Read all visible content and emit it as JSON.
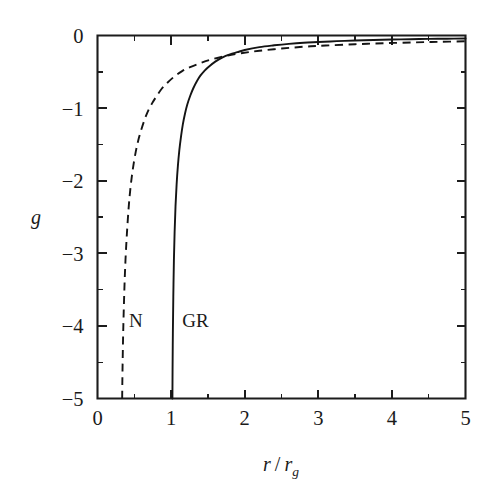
{
  "figure": {
    "background_color": "#ffffff",
    "ink_color": "#1a1a1a"
  },
  "chart_data": {
    "type": "line",
    "title": "",
    "subtitle": "",
    "xlabel": "r / r_g",
    "xlabel_parts": {
      "numerator": "r",
      "slash": "/",
      "denominator": "r",
      "denominator_subscript": "g"
    },
    "ylabel": "g",
    "xlim": [
      0,
      5
    ],
    "ylim": [
      -5,
      0
    ],
    "grid": false,
    "legend_position": "inline-annotations",
    "x_ticks_major": [
      0,
      1,
      2,
      3,
      4,
      5
    ],
    "x_ticklabels": [
      "0",
      "1",
      "2",
      "3",
      "4",
      "5"
    ],
    "x_ticks_minor": [
      0.5,
      1.5,
      2.5,
      3.5,
      4.5
    ],
    "y_ticks_major": [
      0,
      -1,
      -2,
      -3,
      -4,
      -5
    ],
    "y_ticklabels": [
      "0",
      "−1",
      "−2",
      "−3",
      "−4",
      "−5"
    ],
    "y_ticks_minor": [
      -0.5,
      -1.5,
      -2.5,
      -3.5,
      -4.5
    ],
    "tick_direction": "in",
    "annotations": [
      {
        "text": "N",
        "x": 0.52,
        "y": -4.02,
        "series": "N"
      },
      {
        "text": "GR",
        "x": 1.33,
        "y": -4.02,
        "series": "GR"
      }
    ],
    "series": [
      {
        "name": "GR",
        "label": "GR",
        "linestyle": "solid",
        "color": "#141414",
        "asymptote_x": 1.0,
        "x": [
          1.018,
          1.02,
          1.024,
          1.03,
          1.038,
          1.048,
          1.06,
          1.075,
          1.092,
          1.112,
          1.135,
          1.16,
          1.19,
          1.22,
          1.26,
          1.3,
          1.35,
          1.4,
          1.45,
          1.5,
          1.6,
          1.7,
          1.8,
          1.9,
          2.0,
          2.2,
          2.4,
          2.6,
          2.8,
          3.0,
          3.25,
          3.5,
          3.75,
          4.0,
          4.25,
          4.5,
          4.75,
          5.0
        ],
        "y": [
          -5.0,
          -4.6,
          -4.1,
          -3.6,
          -3.1,
          -2.7,
          -2.35,
          -2.05,
          -1.8,
          -1.58,
          -1.39,
          -1.22,
          -1.07,
          -0.95,
          -0.83,
          -0.73,
          -0.63,
          -0.55,
          -0.49,
          -0.44,
          -0.36,
          -0.3,
          -0.26,
          -0.23,
          -0.2,
          -0.16,
          -0.135,
          -0.115,
          -0.1,
          -0.09,
          -0.078,
          -0.069,
          -0.062,
          -0.056,
          -0.051,
          -0.047,
          -0.044,
          -0.041
        ]
      },
      {
        "name": "N",
        "label": "N",
        "linestyle": "dashed",
        "color": "#141414",
        "asymptote_x": 0.33,
        "x": [
          0.335,
          0.34,
          0.35,
          0.365,
          0.38,
          0.4,
          0.425,
          0.45,
          0.48,
          0.52,
          0.56,
          0.6,
          0.65,
          0.7,
          0.75,
          0.8,
          0.875,
          0.95,
          1.05,
          1.15,
          1.25,
          1.4,
          1.55,
          1.75,
          1.95,
          2.2,
          2.5,
          2.8,
          3.1,
          3.5,
          3.9,
          4.3,
          4.65,
          5.0
        ],
        "y": [
          -5.0,
          -4.6,
          -4.05,
          -3.5,
          -3.1,
          -2.72,
          -2.35,
          -2.08,
          -1.84,
          -1.6,
          -1.42,
          -1.28,
          -1.13,
          -1.01,
          -0.92,
          -0.84,
          -0.73,
          -0.65,
          -0.56,
          -0.49,
          -0.44,
          -0.38,
          -0.33,
          -0.28,
          -0.245,
          -0.21,
          -0.18,
          -0.155,
          -0.138,
          -0.12,
          -0.106,
          -0.095,
          -0.087,
          -0.08
        ]
      }
    ]
  }
}
